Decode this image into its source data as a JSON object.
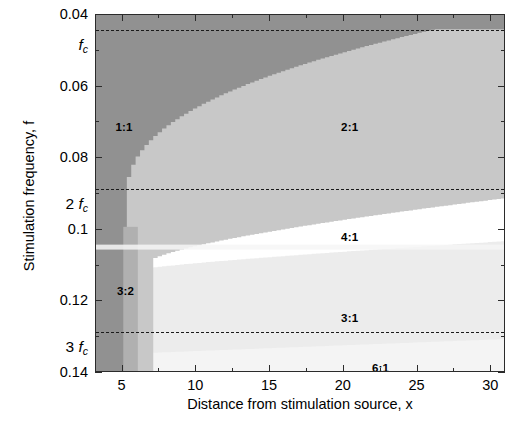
{
  "chart_data": {
    "type": "heatmap",
    "title": "",
    "xlabel": "Distance from stimulation source, x",
    "ylabel": "Stimulation frequency, f",
    "xlim": [
      3.2,
      31.0
    ],
    "ylim": [
      0.04,
      0.14
    ],
    "y_axis_inverted": true,
    "grid": false,
    "legend_position": "none",
    "xticks": [
      5,
      10,
      15,
      20,
      25,
      30
    ],
    "xticklabels": [
      "5",
      "10",
      "15",
      "20",
      "25",
      "30"
    ],
    "xticks_minor": [
      7.5,
      12.5,
      17.5,
      22.5,
      27.5
    ],
    "yticks": [
      0.04,
      0.06,
      0.08,
      0.1,
      0.12,
      0.14
    ],
    "yticklabels": [
      "0.04",
      "0.06",
      "0.08",
      "0.1",
      "0.12",
      "0.14"
    ],
    "yticks_minor": [
      0.05,
      0.07,
      0.09,
      0.11,
      0.13
    ],
    "annotation_lines": [
      {
        "name": "fc",
        "coefficient": "",
        "symbol": "f",
        "subscript": "c",
        "y": 0.0442,
        "style": "dashed"
      },
      {
        "name": "2fc",
        "coefficient": "2",
        "symbol": "f",
        "subscript": "c",
        "y": 0.0885,
        "style": "dashed"
      },
      {
        "name": "3fc",
        "coefficient": "3",
        "symbol": "f",
        "subscript": "c",
        "y": 0.1285,
        "style": "dashed"
      }
    ],
    "regions": [
      {
        "label": "1:1",
        "color": "#919191",
        "label_x": 5.1,
        "label_y": 0.0713
      },
      {
        "label": "3:2",
        "color": "#b0b0b0",
        "label_x": 5.2,
        "label_y": 0.1172
      },
      {
        "label": "2:1",
        "color": "#c8c8c8",
        "label_x": 20.4,
        "label_y": 0.0713
      },
      {
        "label": "4:1",
        "color": "#ffffff",
        "label_x": 20.4,
        "label_y": 0.1019
      },
      {
        "label": "3:1",
        "color": "#ececec",
        "label_x": 20.4,
        "label_y": 0.1246
      },
      {
        "label": "6:1",
        "color": "#f4f4f4",
        "label_x": 22.5,
        "label_y": 0.1386
      }
    ]
  },
  "axis": {
    "x_title": "Distance from stimulation source, x",
    "y_title": "Stimulation frequency, f"
  }
}
